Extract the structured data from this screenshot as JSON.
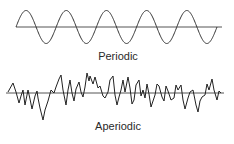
{
  "figure": {
    "panels": [
      {
        "name": "periodic",
        "label": "Periodic",
        "axis": {
          "x1": 16,
          "x2": 222,
          "y": 27
        },
        "wave": {
          "type": "sine",
          "x_start": 16,
          "cycles": 5,
          "period": 40.2,
          "amplitude": 16.5,
          "start_phase": "rising"
        }
      },
      {
        "name": "aperiodic",
        "label": "Aperiodic",
        "axis": {
          "x1": 6,
          "x2": 224,
          "y": 93
        },
        "points": "8,92 13,83 16,92 19,103 21,96 23,90 25,105 28,90 30,99 32,109 35,96 37,91 38,98 40,108 43,120 45,110 48,101 51,90 54,93 56,87 59,79 61,75 63,90 66,105 68,90 70,80 72,93 74,101 76,89 79,82 81,92 83,97 85,87 87,73 89,81 90,76 93,84 95,77 98,88 100,86 103,96 105,98 108,92 110,80 113,76 115,95 117,105 119,97 121,90 123,80 125,92 128,77 130,88 132,104 134,100 136,85 139,80 141,96 143,90 145,98 147,84 149,94 151,107 153,101 155,95 157,84 159,86 162,97 164,101 166,86 168,91 171,100 174,98 176,85 178,90 181,85 183,100 185,109 188,98 190,92 193,90 196,105 198,112 200,101 202,97 205,95 207,84 209,90 212,79 214,90 217,100 219,91 221,93"
      }
    ]
  }
}
